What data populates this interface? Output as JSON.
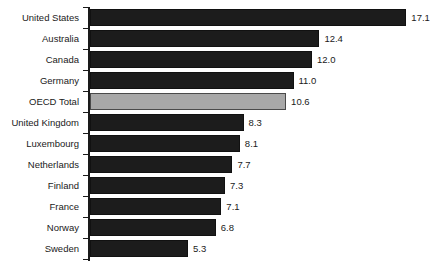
{
  "chart_data": {
    "type": "bar",
    "orientation": "horizontal",
    "title": "",
    "subtitle": "",
    "xlabel": "",
    "ylabel": "",
    "grid": false,
    "legend": "none",
    "axis_tick_labels": [],
    "xlim": [
      0,
      17.1
    ],
    "categories": [
      "United States",
      "Australia",
      "Canada",
      "Germany",
      "OECD Total",
      "United Kingdom",
      "Luxembourg",
      "Netherlands",
      "Finland",
      "France",
      "Norway",
      "Sweden"
    ],
    "values": [
      17.1,
      12.4,
      12.0,
      11.0,
      10.6,
      8.3,
      8.1,
      7.7,
      7.3,
      7.1,
      6.8,
      5.3
    ],
    "value_labels": [
      "17.1",
      "12.4",
      "12.0",
      "11.0",
      "10.6",
      "8.3",
      "8.1",
      "7.7",
      "7.3",
      "7.1",
      "6.8",
      "5.3"
    ],
    "highlight_category": "OECD Total",
    "colors": {
      "bar": "#1c1c1c",
      "bar_outline": "#111111",
      "highlight_bar": "#a8a8a8",
      "highlight_outline": "#4a4a4a",
      "axis": "#1a1a1a",
      "text": "#1a1a1a",
      "background": "#ffffff"
    }
  }
}
